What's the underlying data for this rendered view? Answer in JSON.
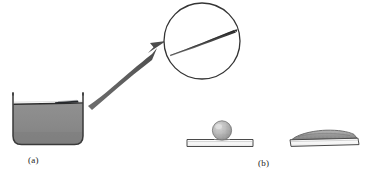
{
  "figure": {
    "panels": [
      {
        "id": "a",
        "label": "(a)",
        "caption_position": "below-beaker",
        "elements": [
          {
            "name": "beaker",
            "description": "open rectangular vessel with rounded bottom corners"
          },
          {
            "name": "liquid",
            "description": "grey liquid filling lower portion of beaker"
          },
          {
            "name": "liquid-surface",
            "description": "dark horizontal meniscus line"
          },
          {
            "name": "floating-needle",
            "description": "dark sliver floating on liquid surface"
          },
          {
            "name": "callout-arrow",
            "description": "thick curved arrow from beaker to magnifier"
          },
          {
            "name": "magnifier-circle",
            "description": "circular magnified inset"
          },
          {
            "name": "magnified-needle",
            "description": "elongated tapering needle inside inset"
          }
        ]
      },
      {
        "id": "b",
        "label": "(b)",
        "caption_position": "below-substrates",
        "elements": [
          {
            "name": "substrate-left",
            "description": "thin flat plate"
          },
          {
            "name": "droplet-sphere",
            "description": "beaded spherical droplet resting on plate"
          },
          {
            "name": "substrate-right",
            "description": "thin flat plate"
          },
          {
            "name": "spread-film",
            "description": "flattened wetting layer spread across plate"
          }
        ]
      }
    ],
    "colors": {
      "liquid_fill": "#8c8c8c",
      "liquid_fill_dark": "#7e7e7e",
      "surface_line": "#2e2e2e",
      "outline": "#2b2b2b",
      "arrow": "#5a5a5a",
      "droplet": "#b5b5b5",
      "droplet_shade": "#8f8f8f",
      "film": "#9a9a9a",
      "background": "#ffffff",
      "label_text": "#1a1a1a"
    },
    "geometry": {
      "canvas_width": 366,
      "canvas_height": 175,
      "beaker": {
        "x": 12,
        "y": 93,
        "width": 72,
        "height": 52
      },
      "magnifier": {
        "cx": 202,
        "cy": 41,
        "r": 38
      },
      "substrate_left": {
        "x": 187,
        "y": 139,
        "width": 66,
        "height": 8
      },
      "substrate_right": {
        "x": 290,
        "y": 135,
        "width": 68,
        "height": 9
      },
      "droplet": {
        "cx": 222,
        "cy": 131,
        "r": 10
      }
    }
  }
}
